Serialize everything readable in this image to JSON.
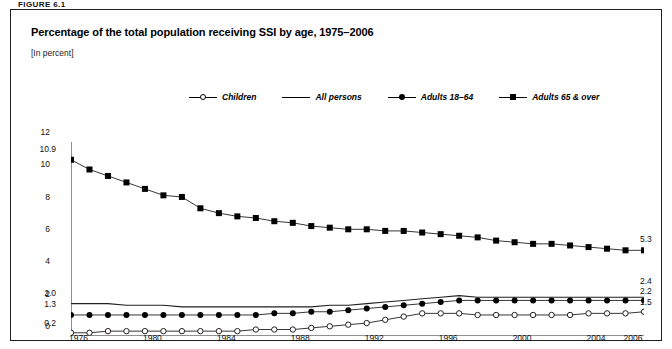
{
  "figure": {
    "label": "FIGURE 6.1"
  },
  "title": "Percentage of the total population receiving SSI by age, 1975–2006",
  "subtitle": "[In percent]",
  "legend": [
    {
      "name": "legend-children",
      "label": "Children",
      "marker": "circle-open"
    },
    {
      "name": "legend-all-persons",
      "label": "All persons",
      "marker": "line"
    },
    {
      "name": "legend-adults-18-64",
      "label": "Adults 18–64",
      "marker": "circle-filled"
    },
    {
      "name": "legend-adults-65-over",
      "label": "Adults 65 & over",
      "marker": "square-filled"
    }
  ],
  "endpoint_labels": {
    "left": {
      "adults65": "10.9",
      "allpersons": "2.0",
      "adults1864": "1.3",
      "children": "0.2"
    },
    "right": {
      "adults65": "5.3",
      "allpersons": "2.4",
      "adults1864": "2.2",
      "children": "1.5"
    }
  },
  "chart_data": {
    "type": "line",
    "title": "Percentage of the total population receiving SSI by age, 1975–2006",
    "subtitle": "[In percent]",
    "xlabel": "",
    "ylabel": "",
    "ylim": [
      0,
      12
    ],
    "yticks": [
      0,
      2,
      4,
      6,
      8,
      10,
      12
    ],
    "xlim": [
      1975,
      2006
    ],
    "xticks": [
      1976,
      1980,
      1984,
      1988,
      1992,
      1996,
      2000,
      2004,
      2006
    ],
    "grid": false,
    "legend_position": "top-center",
    "x": [
      1975,
      1976,
      1977,
      1978,
      1979,
      1980,
      1981,
      1982,
      1983,
      1984,
      1985,
      1986,
      1987,
      1988,
      1989,
      1990,
      1991,
      1992,
      1993,
      1994,
      1995,
      1996,
      1997,
      1998,
      1999,
      2000,
      2001,
      2002,
      2003,
      2004,
      2005,
      2006
    ],
    "series": [
      {
        "name": "Adults 65 & over",
        "marker": "square-filled",
        "values": [
          10.9,
          10.3,
          9.9,
          9.5,
          9.1,
          8.7,
          8.6,
          7.9,
          7.6,
          7.4,
          7.3,
          7.1,
          7.0,
          6.8,
          6.7,
          6.6,
          6.6,
          6.5,
          6.5,
          6.4,
          6.3,
          6.2,
          6.1,
          5.9,
          5.8,
          5.7,
          5.7,
          5.6,
          5.5,
          5.4,
          5.3,
          5.3
        ]
      },
      {
        "name": "All persons",
        "marker": "line",
        "values": [
          2.0,
          2.0,
          2.0,
          1.9,
          1.9,
          1.9,
          1.8,
          1.8,
          1.8,
          1.8,
          1.8,
          1.8,
          1.8,
          1.8,
          1.9,
          1.9,
          2.0,
          2.1,
          2.2,
          2.3,
          2.4,
          2.5,
          2.4,
          2.4,
          2.4,
          2.4,
          2.4,
          2.4,
          2.4,
          2.4,
          2.4,
          2.4
        ]
      },
      {
        "name": "Adults 18–64",
        "marker": "circle-filled",
        "values": [
          1.3,
          1.3,
          1.3,
          1.3,
          1.3,
          1.3,
          1.3,
          1.3,
          1.3,
          1.3,
          1.3,
          1.4,
          1.4,
          1.5,
          1.5,
          1.6,
          1.7,
          1.8,
          1.9,
          2.0,
          2.1,
          2.2,
          2.2,
          2.2,
          2.2,
          2.2,
          2.2,
          2.2,
          2.2,
          2.2,
          2.2,
          2.2
        ]
      },
      {
        "name": "Children",
        "marker": "circle-open",
        "values": [
          0.2,
          0.2,
          0.3,
          0.3,
          0.3,
          0.3,
          0.3,
          0.3,
          0.3,
          0.3,
          0.4,
          0.4,
          0.4,
          0.5,
          0.6,
          0.7,
          0.8,
          1.0,
          1.2,
          1.4,
          1.4,
          1.4,
          1.3,
          1.3,
          1.3,
          1.3,
          1.3,
          1.3,
          1.4,
          1.4,
          1.4,
          1.5
        ]
      }
    ]
  }
}
